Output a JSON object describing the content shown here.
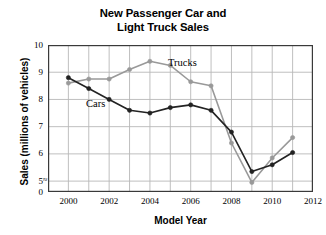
{
  "chart_data": {
    "type": "line",
    "title": "New Passenger Car and Light Truck Sales",
    "title_line1": "New Passenger Car and",
    "title_line2": "Light Truck Sales",
    "xlabel": "Model Year",
    "ylabel": "Sales (millions of vehicles)",
    "x": [
      2000,
      2001,
      2002,
      2003,
      2004,
      2005,
      2006,
      2007,
      2008,
      2009,
      2010,
      2011
    ],
    "xlim": [
      1999,
      2012
    ],
    "ylim": [
      4.6,
      10
    ],
    "y_axis_break": true,
    "y_axis_break_symbol": "≈",
    "grid": true,
    "legend": "inline-labels",
    "xticks": [
      "2000",
      "2002",
      "2004",
      "2006",
      "2008",
      "2010",
      "2012"
    ],
    "xtick_values": [
      2000,
      2002,
      2004,
      2006,
      2008,
      2010,
      2012
    ],
    "yticks": [
      "0",
      "5",
      "6",
      "7",
      "8",
      "9",
      "10"
    ],
    "ytick_values": [
      0,
      5,
      6,
      7,
      8,
      9,
      10
    ],
    "series": [
      {
        "name": "Cars",
        "color": "#222222",
        "marker": "filled-circle",
        "values": [
          8.8,
          8.4,
          8.0,
          7.6,
          7.5,
          7.7,
          7.8,
          7.6,
          6.8,
          5.35,
          5.6,
          6.05
        ]
      },
      {
        "name": "Trucks",
        "color": "#999999",
        "marker": "filled-circle",
        "values": [
          8.6,
          8.75,
          8.75,
          9.1,
          9.4,
          9.25,
          8.65,
          8.5,
          6.4,
          4.95,
          5.85,
          6.6
        ]
      }
    ]
  },
  "colors": {
    "cars": "#222222",
    "trucks": "#999999",
    "grid": "#b8b8b8",
    "axis": "#3a3a3a",
    "background": "#ffffff",
    "text": "#000000"
  }
}
